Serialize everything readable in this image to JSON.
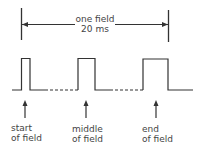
{
  "diagram": {
    "title_line1": "one field",
    "title_line2": "20 ms",
    "markers": [
      {
        "line1": "start",
        "line2": "of field"
      },
      {
        "line1": "middle",
        "line2": "of field"
      },
      {
        "line1": "end",
        "line2": "of field"
      }
    ],
    "colors": {
      "stroke": "#333333",
      "text": "#444444"
    }
  }
}
